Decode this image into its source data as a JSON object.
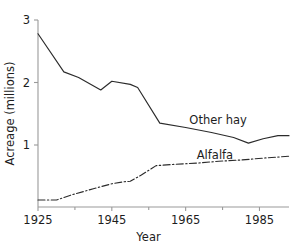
{
  "chart_data": {
    "type": "line",
    "title": "",
    "subtitle": "",
    "xlabel": "Year",
    "ylabel": "Acreage (millions)",
    "xlim": [
      1925,
      1993
    ],
    "ylim": [
      0,
      3
    ],
    "grid": false,
    "legend_position": "inline-annotations",
    "x_ticks_major": [
      1925,
      1945,
      1965,
      1985
    ],
    "x_tick_labels": [
      "1925",
      "1945",
      "1965",
      "1985"
    ],
    "x_ticks_minor": [
      1935,
      1955,
      1975
    ],
    "y_ticks": [
      1,
      2,
      3
    ],
    "y_tick_labels": [
      "1",
      "2",
      "3"
    ],
    "annotations": [
      {
        "text": "Other hay",
        "x": 1966,
        "y": 1.33
      },
      {
        "text": "Alfalfa",
        "x": 1968,
        "y": 0.77
      }
    ],
    "series": [
      {
        "name": "Other hay",
        "style": "solid",
        "x": [
          1925,
          1932,
          1936,
          1942,
          1945,
          1950,
          1952,
          1958,
          1965,
          1972,
          1978,
          1982,
          1986,
          1990,
          1993
        ],
        "values": [
          2.78,
          2.17,
          2.08,
          1.88,
          2.02,
          1.97,
          1.92,
          1.35,
          1.28,
          1.2,
          1.12,
          1.03,
          1.1,
          1.15,
          1.15
        ]
      },
      {
        "name": "Alfalfa",
        "style": "dash-dot",
        "x": [
          1925,
          1930,
          1934,
          1940,
          1945,
          1948,
          1950,
          1953,
          1957,
          1962,
          1968,
          1974,
          1980,
          1986,
          1993
        ],
        "values": [
          0.12,
          0.12,
          0.2,
          0.3,
          0.38,
          0.41,
          0.42,
          0.52,
          0.67,
          0.69,
          0.71,
          0.74,
          0.76,
          0.79,
          0.82
        ]
      }
    ]
  },
  "layout": {
    "plot_left_px": 38,
    "plot_right_px": 289,
    "plot_top_px": 20,
    "plot_bottom_px": 207,
    "y_px_per_unit": 62.5,
    "y_one_px": 145
  }
}
